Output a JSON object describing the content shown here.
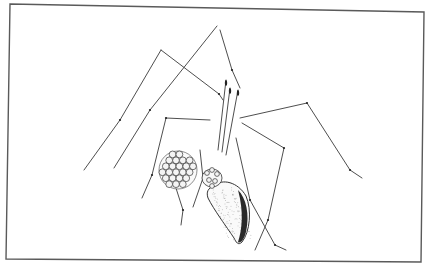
{
  "image": {
    "subject": "Cellar spider (daddy long-legs) carrying egg sac in chelicerae",
    "style": "black ink line drawing on white background inside a thin rectangular frame",
    "width": 430,
    "height": 265,
    "colors": {
      "background": "#ffffff",
      "frame": "#5a5a5a",
      "ink": "#333333",
      "shading": "#2a2a2a"
    },
    "frame": {
      "points": [
        [
          10,
          4
        ],
        [
          424,
          12
        ],
        [
          421,
          262
        ],
        [
          6,
          259
        ]
      ]
    },
    "legs": [
      {
        "name": "left-front-leg-1",
        "points": [
          [
            161,
            50
          ],
          [
            219,
            94
          ],
          [
            223,
            100
          ]
        ]
      },
      {
        "name": "left-outer-leg",
        "points": [
          [
            161,
            50
          ],
          [
            120,
            120
          ],
          [
            84,
            170
          ]
        ]
      },
      {
        "name": "top-leg-upper",
        "points": [
          [
            217,
            26
          ],
          [
            150,
            110
          ],
          [
            114,
            168
          ]
        ]
      },
      {
        "name": "top-leg-lower",
        "points": [
          [
            220,
            30
          ],
          [
            232,
            70
          ],
          [
            240,
            88
          ]
        ]
      },
      {
        "name": "right-upper-leg",
        "points": [
          [
            240,
            118
          ],
          [
            307,
            103
          ],
          [
            350,
            170
          ],
          [
            362,
            178
          ]
        ]
      },
      {
        "name": "right-mid-leg",
        "points": [
          [
            242,
            123
          ],
          [
            284,
            148
          ],
          [
            268,
            220
          ],
          [
            255,
            250
          ]
        ]
      },
      {
        "name": "right-lower-leg",
        "points": [
          [
            236,
            138
          ],
          [
            250,
            200
          ],
          [
            275,
            245
          ],
          [
            286,
            250
          ]
        ]
      },
      {
        "name": "left-mid-leg",
        "points": [
          [
            210,
            120
          ],
          [
            166,
            118
          ],
          [
            152,
            175
          ],
          [
            142,
            198
          ]
        ]
      },
      {
        "name": "left-lower-leg",
        "points": [
          [
            175,
            185
          ],
          [
            183,
            210
          ],
          [
            181,
            225
          ]
        ]
      },
      {
        "name": "front-inner-leg",
        "points": [
          [
            200,
            150
          ],
          [
            203,
            178
          ],
          [
            193,
            207
          ]
        ]
      }
    ],
    "palps": [
      {
        "name": "palp-1",
        "points": [
          [
            226,
            80
          ],
          [
            218,
            150
          ]
        ]
      },
      {
        "name": "palp-2",
        "points": [
          [
            230,
            88
          ],
          [
            222,
            152
          ]
        ]
      },
      {
        "name": "palp-3",
        "points": [
          [
            238,
            90
          ],
          [
            226,
            155
          ]
        ]
      }
    ],
    "egg_sac": {
      "cx": 178,
      "cy": 170,
      "r": 19,
      "egg_r": 3.4
    },
    "cephalothorax": {
      "cx": 212,
      "cy": 178,
      "rx": 10,
      "ry": 9
    },
    "abdomen": {
      "path": "M214 186 C222 178 238 182 246 196 C252 210 250 232 242 242 C238 246 236 242 234 238 C226 226 214 210 208 198 C206 192 208 188 214 186 Z"
    }
  }
}
